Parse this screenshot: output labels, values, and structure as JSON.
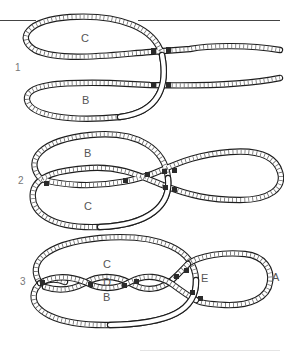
{
  "figure": {
    "steps": [
      {
        "number": "1",
        "labels": {
          "upper_loop": "C",
          "lower_loop": "B"
        }
      },
      {
        "number": "2",
        "labels": {
          "upper_loop": "B",
          "lower_loop": "C"
        }
      },
      {
        "number": "3",
        "labels": {
          "top": "C",
          "center": "D",
          "bottom": "B",
          "crossing": "E",
          "end_loop": "A"
        }
      }
    ]
  },
  "colors": {
    "rope_outline": "#1e1e1e",
    "rope_fill": "#ffffff",
    "label_text": "#555555",
    "rule_line": "#444444"
  }
}
